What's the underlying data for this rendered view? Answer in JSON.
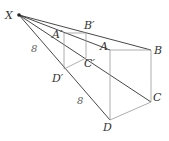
{
  "labels": {
    "X": "X",
    "A_prime": "A′",
    "B_prime": "B′",
    "C_prime": "C′",
    "D_prime": "D′",
    "A": "A",
    "B": "B",
    "C": "C",
    "D": "D",
    "len_XD_prime": "8",
    "len_D_prime_D": "8"
  },
  "colors": {
    "dark_line": "#333333",
    "light_line": "#999999"
  }
}
